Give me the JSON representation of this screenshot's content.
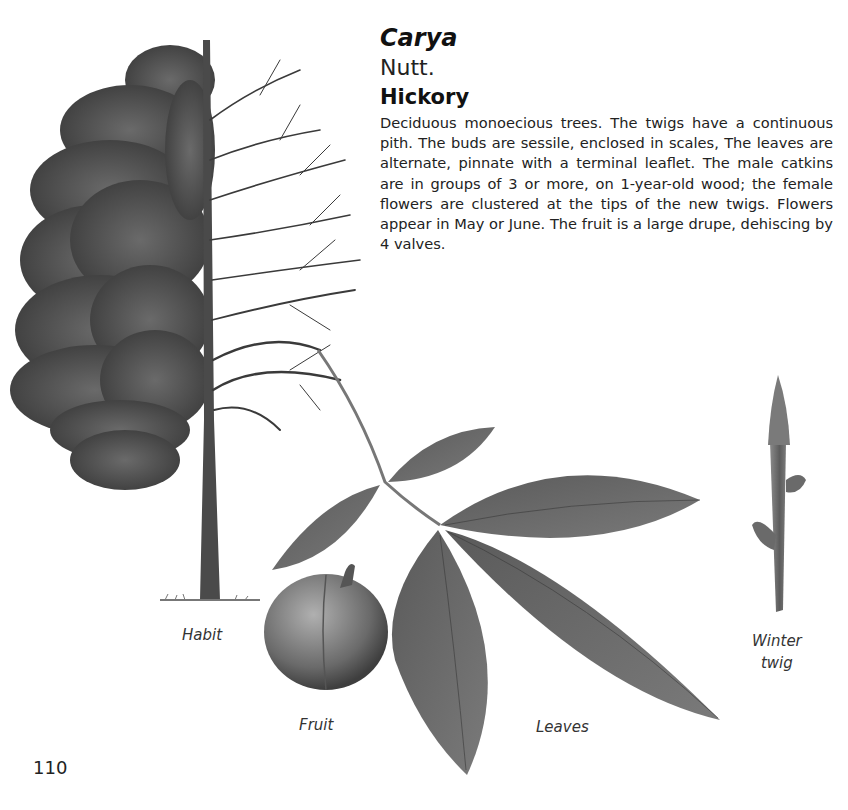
{
  "entry": {
    "genus": "Carya",
    "author": "Nutt.",
    "common_name": "Hickory",
    "description": "Deciduous monoecious trees. The twigs have a continuous pith. The buds are sessile, enclosed in scales, The leaves are alternate, pinnate with a terminal leaflet. The male catkins are in groups of 3 or more, on 1-year-old wood; the female flowers are clustered at the tips of the new twigs. Flowers appear in May or June. The fruit is a large drupe, dehiscing by 4 valves."
  },
  "illustrations": {
    "habit_label": "Habit",
    "fruit_label": "Fruit",
    "leaves_label": "Leaves",
    "winter_twig_label_line1": "Winter",
    "winter_twig_label_line2": "twig"
  },
  "page": {
    "number": "110"
  }
}
